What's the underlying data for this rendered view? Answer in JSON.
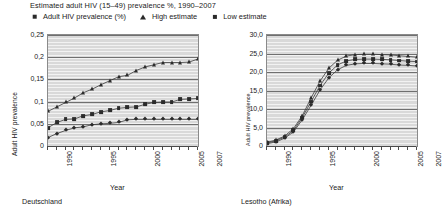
{
  "header": {
    "title": "Estimated adult HIV (15–49) prevalence %, 1990–2007",
    "legend": [
      {
        "marker": "square-marker-icon",
        "label": "Adult HIV prevalence (%)"
      },
      {
        "marker": "triangle-marker-icon",
        "label": "High estimate"
      },
      {
        "marker": "diamond-marker-icon",
        "label": "Low estimate"
      }
    ]
  },
  "chart_data": [
    {
      "type": "line",
      "panel": "left",
      "title": "",
      "caption": "Deutschland",
      "xlabel": "Year",
      "ylabel": "Adult HIV prevalence",
      "x": [
        1990,
        1991,
        1992,
        1993,
        1994,
        1995,
        1996,
        1997,
        1998,
        1999,
        2000,
        2001,
        2002,
        2003,
        2004,
        2005,
        2006,
        2007
      ],
      "xlim": [
        1990,
        2007
      ],
      "ylim": [
        0,
        0.25
      ],
      "xticks": [
        "1990",
        "1995",
        "2000",
        "2005",
        "2007"
      ],
      "xtick_values": [
        1990,
        1995,
        2000,
        2005,
        2007
      ],
      "yticks": [
        "0",
        "0,05",
        "0,1",
        "0,15",
        "0,2",
        "0,25"
      ],
      "ytick_values": [
        0,
        0.05,
        0.1,
        0.15,
        0.2,
        0.25
      ],
      "grid": true,
      "legend_position": "top",
      "series": [
        {
          "name": "High estimate",
          "marker": "triangle",
          "values": [
            0.078,
            0.088,
            0.098,
            0.108,
            0.12,
            0.128,
            0.138,
            0.147,
            0.156,
            0.159,
            0.17,
            0.178,
            0.183,
            0.188,
            0.188,
            0.188,
            0.189,
            0.196
          ]
        },
        {
          "name": "Adult HIV prevalence (%)",
          "marker": "square",
          "values": [
            0.041,
            0.053,
            0.06,
            0.061,
            0.068,
            0.071,
            0.077,
            0.08,
            0.085,
            0.087,
            0.088,
            0.094,
            0.098,
            0.099,
            0.099,
            0.105,
            0.106,
            0.107
          ]
        },
        {
          "name": "Low estimate",
          "marker": "diamond",
          "values": [
            0.019,
            0.028,
            0.035,
            0.041,
            0.043,
            0.048,
            0.05,
            0.051,
            0.053,
            0.059,
            0.06,
            0.06,
            0.06,
            0.06,
            0.06,
            0.06,
            0.06,
            0.06
          ]
        }
      ]
    },
    {
      "type": "line",
      "panel": "right",
      "title": "",
      "caption": "Lesotho (Afrika)",
      "xlabel": "Year",
      "ylabel": "Adult HIV prevalence",
      "x": [
        1990,
        1991,
        1992,
        1993,
        1994,
        1995,
        1996,
        1997,
        1998,
        1999,
        2000,
        2001,
        2002,
        2003,
        2004,
        2005,
        2006,
        2007
      ],
      "xlim": [
        1990,
        2007
      ],
      "ylim": [
        0,
        30
      ],
      "xticks": [
        "1990",
        "1995",
        "2000",
        "2005",
        "2007"
      ],
      "xtick_values": [
        1990,
        1995,
        2000,
        2005,
        2007
      ],
      "yticks": [
        "0",
        "5,0",
        "10,0",
        "15,0",
        "20,0",
        "25,0",
        "30,0"
      ],
      "ytick_values": [
        0,
        5,
        10,
        15,
        20,
        25,
        30
      ],
      "grid": true,
      "legend_position": "top",
      "series": [
        {
          "name": "High estimate",
          "marker": "triangle",
          "values": [
            1.0,
            1.6,
            2.7,
            4.7,
            8.2,
            13.0,
            17.5,
            21.0,
            23.2,
            24.3,
            24.7,
            24.8,
            24.8,
            24.7,
            24.6,
            24.4,
            24.2,
            24.0
          ]
        },
        {
          "name": "Adult HIV prevalence (%)",
          "marker": "square",
          "values": [
            0.8,
            1.4,
            2.4,
            4.2,
            7.7,
            12.0,
            16.3,
            19.7,
            21.9,
            23.0,
            23.4,
            23.5,
            23.5,
            23.4,
            23.3,
            23.1,
            22.9,
            22.8
          ]
        },
        {
          "name": "Low estimate",
          "marker": "diamond",
          "values": [
            0.6,
            1.1,
            2.1,
            3.8,
            7.1,
            11.0,
            15.1,
            18.4,
            20.6,
            21.8,
            22.2,
            22.3,
            22.3,
            22.2,
            22.1,
            21.9,
            21.8,
            21.6
          ]
        }
      ]
    }
  ]
}
